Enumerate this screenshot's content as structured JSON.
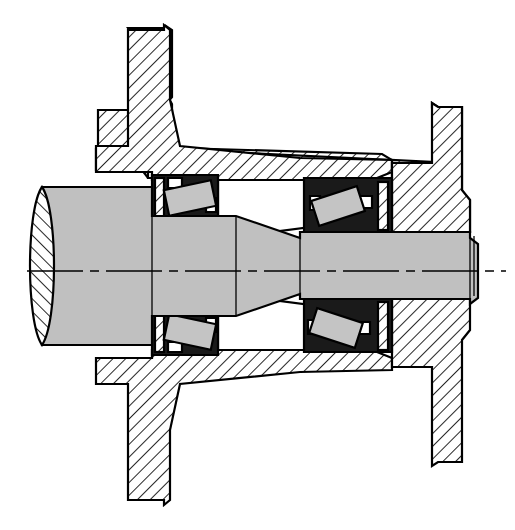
{
  "drawing": {
    "title": "Tapered roller bearing wheel hub assembly cross-section",
    "type": "engineering-sectional-drawing",
    "view": "longitudinal half-section about horizontal axis",
    "canvas": {
      "width": 515,
      "height": 530,
      "background": "#ffffff"
    },
    "palette": {
      "line": "#000000",
      "shaft_fill": "#c0c0c0",
      "roller_fill": "#c4c4c4",
      "bearing_race_fill": "#1a1a1a",
      "housing_hatch_fill": "#ffffff",
      "void_fill": "#ffffff"
    },
    "axis": {
      "label": "centerline",
      "style": "dash-dot",
      "y": 271,
      "x_start": 27,
      "x_end": 506
    },
    "components": [
      {
        "name": "shaft",
        "fill": "shaft_fill",
        "note": "stepped and tapered shaft running full width, broken-off left end with elliptical cut face"
      },
      {
        "name": "shaft-broken-end-face",
        "fill": "hatch",
        "note": "elliptical section face at left, hatched"
      },
      {
        "name": "upper-housing-flange",
        "fill": "hatch",
        "note": "upper wheel / brake-drum flange with stepped rim, 45 degree section hatch"
      },
      {
        "name": "lower-housing-flange",
        "fill": "hatch",
        "note": "lower mirrored wheel / brake-drum flange"
      },
      {
        "name": "right-upper-hub-web",
        "fill": "hatch",
        "note": "upper right vertical hub web and rim"
      },
      {
        "name": "right-lower-hub-web",
        "fill": "hatch",
        "note": "lower right vertical hub web and rim"
      },
      {
        "name": "bearing-upper-left",
        "fill": "bearing_race_fill",
        "note": "tapered roller bearing, outer race black, roller tilted"
      },
      {
        "name": "bearing-upper-right",
        "fill": "bearing_race_fill",
        "note": "tapered roller bearing, outer race black, roller tilted"
      },
      {
        "name": "bearing-lower-left",
        "fill": "bearing_race_fill",
        "note": "tapered roller bearing, outer race black, roller tilted"
      },
      {
        "name": "bearing-lower-right",
        "fill": "bearing_race_fill",
        "note": "tapered roller bearing, outer race black, roller tilted"
      },
      {
        "name": "bearing-cavity-upper",
        "fill": "void_fill",
        "note": "white internal cavity between the two upper bearings"
      },
      {
        "name": "bearing-cavity-lower",
        "fill": "void_fill",
        "note": "white internal cavity between the two lower bearings"
      }
    ],
    "bearings": [
      {
        "id": "upper-left",
        "roller_angle_deg": -12,
        "roller_cx": 189,
        "roller_cy": 197,
        "roller_w": 44,
        "roller_h": 24
      },
      {
        "id": "upper-right",
        "roller_cx": 336,
        "roller_cy": 206,
        "roller_angle_deg": -18,
        "roller_w": 44,
        "roller_h": 24
      },
      {
        "id": "lower-left",
        "roller_cx": 189,
        "roller_cy": 348,
        "roller_angle_deg": 12,
        "roller_w": 44,
        "roller_h": 24
      },
      {
        "id": "lower-right",
        "roller_cx": 334,
        "roller_cy": 338,
        "roller_angle_deg": 18,
        "roller_w": 44,
        "roller_h": 24
      }
    ],
    "labels": [],
    "annotations": [],
    "text_items": []
  }
}
